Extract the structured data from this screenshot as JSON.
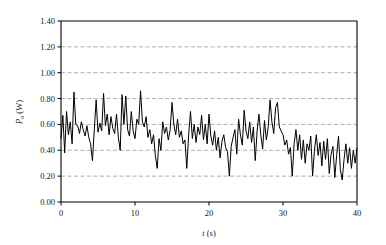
{
  "chart_data": {
    "type": "line",
    "title": "",
    "subtitle": "",
    "xlabel": "t (s)",
    "xlabel_italic": "t",
    "xlabel_unit": "(s)",
    "ylabel": "Po (W)",
    "ylabel_symbol": "P",
    "ylabel_subscript": "o",
    "ylabel_unit": "(W)",
    "xlim": [
      0,
      40
    ],
    "ylim": [
      0.0,
      1.4
    ],
    "xticks": [
      0,
      10,
      20,
      30,
      40
    ],
    "xtick_labels": [
      "0",
      "10",
      "20",
      "30",
      "40"
    ],
    "yticks": [
      0.0,
      0.2,
      0.4,
      0.6,
      0.8,
      1.0,
      1.2,
      1.4
    ],
    "ytick_labels": [
      "0.00",
      "0.20",
      "0.40",
      "0.60",
      "0.80",
      "1.00",
      "1.20",
      "1.40"
    ],
    "grid": true,
    "grid_axis": "y",
    "grid_style": "dashed",
    "grid_color": "#999999",
    "legend": false,
    "legend_position": "none",
    "line_color": "#000000",
    "line_width": 1.0,
    "axis_color": "#000000",
    "background_color": "#ffffff",
    "series": [
      {
        "name": "Po",
        "x": [
          0.0,
          0.25,
          0.5,
          0.75,
          1.0,
          1.25,
          1.5,
          1.75,
          2.0,
          2.25,
          2.5,
          2.75,
          3.0,
          3.25,
          3.5,
          3.75,
          4.0,
          4.25,
          4.5,
          4.75,
          5.0,
          5.25,
          5.5,
          5.75,
          6.0,
          6.25,
          6.5,
          6.75,
          7.0,
          7.25,
          7.5,
          7.75,
          8.0,
          8.25,
          8.5,
          8.75,
          9.0,
          9.25,
          9.5,
          9.75,
          10.0,
          10.25,
          10.5,
          10.75,
          11.0,
          11.25,
          11.5,
          11.75,
          12.0,
          12.25,
          12.5,
          12.75,
          13.0,
          13.25,
          13.5,
          13.75,
          14.0,
          14.25,
          14.5,
          14.75,
          15.0,
          15.25,
          15.5,
          15.75,
          16.0,
          16.25,
          16.5,
          16.75,
          17.0,
          17.25,
          17.5,
          17.75,
          18.0,
          18.25,
          18.5,
          18.75,
          19.0,
          19.25,
          19.5,
          19.75,
          20.0,
          20.25,
          20.5,
          20.75,
          21.0,
          21.25,
          21.5,
          21.75,
          22.0,
          22.25,
          22.5,
          22.75,
          23.0,
          23.25,
          23.5,
          23.75,
          24.0,
          24.25,
          24.5,
          24.75,
          25.0,
          25.25,
          25.5,
          25.75,
          26.0,
          26.25,
          26.5,
          26.75,
          27.0,
          27.25,
          27.5,
          27.75,
          28.0,
          28.25,
          28.5,
          28.75,
          29.0,
          29.25,
          29.5,
          29.75,
          30.0,
          30.25,
          30.5,
          30.75,
          31.0,
          31.25,
          31.5,
          31.75,
          32.0,
          32.25,
          32.5,
          32.75,
          33.0,
          33.25,
          33.5,
          33.75,
          34.0,
          34.25,
          34.5,
          34.75,
          35.0,
          35.25,
          35.5,
          35.75,
          36.0,
          36.25,
          36.5,
          36.75,
          37.0,
          37.25,
          37.5,
          37.75,
          38.0,
          38.25,
          38.5,
          38.75,
          39.0,
          39.25,
          39.5,
          39.75,
          40.0
        ],
        "y": [
          0.49,
          0.67,
          0.38,
          0.7,
          0.52,
          0.62,
          0.45,
          0.85,
          0.6,
          0.59,
          0.53,
          0.62,
          0.56,
          0.51,
          0.59,
          0.5,
          0.45,
          0.32,
          0.56,
          0.79,
          0.54,
          0.61,
          0.55,
          0.84,
          0.59,
          0.68,
          0.52,
          0.66,
          0.57,
          0.53,
          0.68,
          0.5,
          0.4,
          0.83,
          0.6,
          0.82,
          0.56,
          0.51,
          0.7,
          0.55,
          0.49,
          0.64,
          0.6,
          0.86,
          0.62,
          0.58,
          0.66,
          0.5,
          0.56,
          0.45,
          0.52,
          0.36,
          0.26,
          0.49,
          0.4,
          0.62,
          0.53,
          0.58,
          0.48,
          0.56,
          0.77,
          0.6,
          0.52,
          0.64,
          0.5,
          0.55,
          0.45,
          0.48,
          0.26,
          0.52,
          0.7,
          0.49,
          0.6,
          0.46,
          0.58,
          0.52,
          0.67,
          0.48,
          0.6,
          0.45,
          0.68,
          0.51,
          0.44,
          0.55,
          0.4,
          0.5,
          0.34,
          0.47,
          0.52,
          0.42,
          0.39,
          0.2,
          0.43,
          0.5,
          0.56,
          0.37,
          0.64,
          0.52,
          0.44,
          0.71,
          0.55,
          0.49,
          0.62,
          0.46,
          0.58,
          0.32,
          0.55,
          0.68,
          0.52,
          0.41,
          0.63,
          0.48,
          0.58,
          0.79,
          0.62,
          0.53,
          0.73,
          0.77,
          0.58,
          0.55,
          0.52,
          0.44,
          0.48,
          0.37,
          0.42,
          0.2,
          0.45,
          0.56,
          0.4,
          0.52,
          0.33,
          0.48,
          0.3,
          0.45,
          0.4,
          0.51,
          0.2,
          0.4,
          0.52,
          0.36,
          0.46,
          0.28,
          0.47,
          0.33,
          0.49,
          0.22,
          0.37,
          0.43,
          0.19,
          0.36,
          0.51,
          0.25,
          0.17,
          0.33,
          0.45,
          0.3,
          0.42,
          0.26,
          0.4,
          0.3,
          0.42
        ]
      }
    ]
  }
}
